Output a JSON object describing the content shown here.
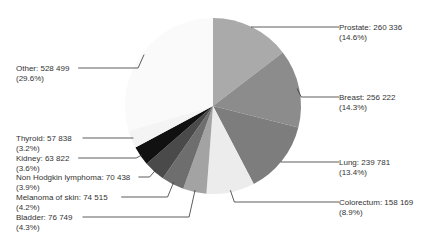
{
  "chart_data": {
    "type": "pie",
    "title": "",
    "start_angle_deg": 0,
    "direction": "clockwise",
    "center": [
      213,
      106
    ],
    "radius": 88,
    "slices": [
      {
        "name": "Prostate",
        "value": 260336,
        "value_label": "260 336",
        "pct_label": "(14.6%)",
        "pct": 14.6,
        "color": "#aaaaaa",
        "side": "right",
        "label_xy": [
          339,
          23
        ]
      },
      {
        "name": "Breast",
        "value": 256222,
        "value_label": "256 222",
        "pct_label": "(14.3%)",
        "pct": 14.3,
        "color": "#8c8c8c",
        "side": "right",
        "label_xy": [
          339,
          93
        ]
      },
      {
        "name": "Lung",
        "value": 239781,
        "value_label": "239 781",
        "pct_label": "(13.4%)",
        "pct": 13.4,
        "color": "#7d7d7d",
        "side": "right",
        "label_xy": [
          339,
          158
        ]
      },
      {
        "name": "Colorectum",
        "value": 158169,
        "value_label": "158 169",
        "pct_label": "(8.9%)",
        "pct": 8.9,
        "color": "#ececec",
        "side": "right",
        "label_xy": [
          339,
          198
        ]
      },
      {
        "name": "Bladder",
        "value": 76749,
        "value_label": "76 749",
        "pct_label": "(4.3%)",
        "pct": 4.3,
        "color": "#a3a3a3",
        "side": "left",
        "label_xy": [
          16,
          213
        ]
      },
      {
        "name": "Melanoma of skin",
        "value": 74515,
        "value_label": "74 515",
        "pct_label": "(4.2%)",
        "pct": 4.2,
        "color": "#6e6e6e",
        "side": "left",
        "label_xy": [
          16,
          193
        ]
      },
      {
        "name": "Non Hodgkin lymphoma",
        "value": 70438,
        "value_label": "70 438",
        "pct_label": "(3.9%)",
        "pct": 3.9,
        "color": "#4a4a4a",
        "side": "left",
        "label_xy": [
          16,
          173
        ]
      },
      {
        "name": "Kidney",
        "value": 63822,
        "value_label": "63 822",
        "pct_label": "(3.6%)",
        "pct": 3.6,
        "color": "#111111",
        "side": "left",
        "label_xy": [
          16,
          154
        ]
      },
      {
        "name": "Thyroid",
        "value": 57838,
        "value_label": "57 838",
        "pct_label": "(3.2%)",
        "pct": 3.2,
        "color": "#f4f4f4",
        "side": "left",
        "label_xy": [
          16,
          134
        ]
      },
      {
        "name": "Other",
        "value": 528499,
        "value_label": "528 499",
        "pct_label": "(29.6%)",
        "pct": 29.6,
        "color": "#fafafa",
        "side": "left",
        "label_xy": [
          16,
          64
        ]
      }
    ],
    "legend": "none (direct labels with leader lines)"
  }
}
